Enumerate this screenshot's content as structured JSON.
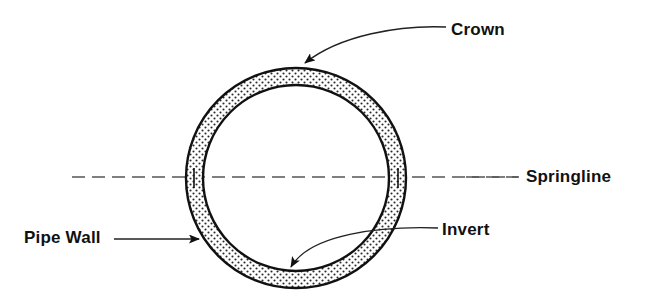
{
  "diagram": {
    "background_color": "#ffffff",
    "line_color": "#111111",
    "fill_pattern": "stipple-dots",
    "labels": {
      "crown": "Crown",
      "springline": "Springline",
      "invert": "Invert",
      "pipe_wall": "Pipe Wall"
    },
    "geometry": {
      "center_x": 296,
      "center_y": 178,
      "outer_radius": 110,
      "inner_radius": 93,
      "wall_thickness": 17
    },
    "springline_axis": {
      "style": "dash-dot",
      "y": 177,
      "x_start": 72,
      "x_end": 518
    },
    "leaders": {
      "crown": {
        "style": "curved",
        "arrow_x": 297,
        "arrow_y": 72
      },
      "invert": {
        "style": "curved",
        "arrow_x": 298,
        "arrow_y": 269
      },
      "pipe_wall": {
        "style": "straight",
        "arrow_x": 200,
        "arrow_y": 239
      },
      "springline": {
        "style": "dash-dot-extension"
      }
    }
  }
}
